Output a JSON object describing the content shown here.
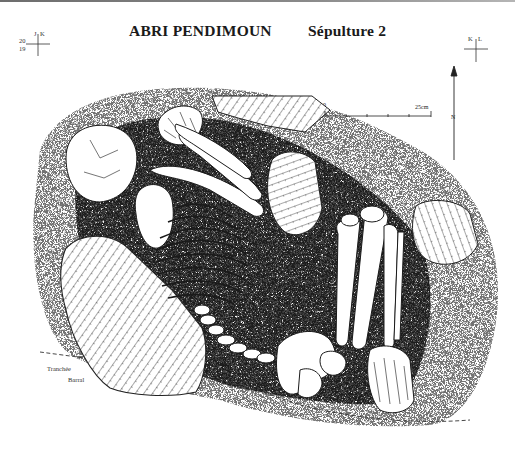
{
  "figure": {
    "title": "ABRI PENDIMOUN",
    "subtitle": "Sépulture 2",
    "grid_markers": {
      "left": {
        "top_labels": [
          "J",
          "K"
        ],
        "side_labels": [
          "20",
          "19"
        ]
      },
      "right": {
        "top_labels": [
          "K",
          "L"
        ]
      }
    },
    "scale_bar": {
      "start_label": "0",
      "end_label": "25cm",
      "ticks": 6
    },
    "north_arrow": {
      "label": "N"
    },
    "annotation": {
      "line1": "Tranchée",
      "line2": "Barral"
    },
    "colors": {
      "ink": "#1a1a1a",
      "paper": "#ffffff",
      "stipple": "#3a3a3a",
      "header_rule": "#6d6d6d"
    }
  }
}
